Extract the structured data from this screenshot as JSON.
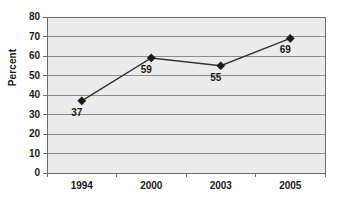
{
  "chart_data": {
    "type": "line",
    "title": "",
    "xlabel": "",
    "ylabel": "Percent",
    "categories": [
      "1994",
      "2000",
      "2003",
      "2005"
    ],
    "values": [
      37,
      59,
      55,
      69
    ],
    "point_labels": [
      "37",
      "59",
      "55",
      "69"
    ],
    "series": [
      {
        "name": "Percent",
        "values": [
          37,
          59,
          55,
          69
        ]
      }
    ],
    "ylim": [
      0,
      80
    ],
    "ytick_step": 10,
    "ytick_labels": [
      "0",
      "10",
      "20",
      "30",
      "40",
      "50",
      "60",
      "70",
      "80"
    ],
    "xtick_labels": [
      "1994",
      "2000",
      "2003",
      "2005"
    ],
    "grid": "horizontal",
    "legend": "none",
    "marker": "diamond",
    "colors": {
      "plot_background": "#ebebeb",
      "gridline": "#8c8c8c",
      "axis": "#6e6e6e",
      "series_line": "#333333",
      "marker": "#1a1a1a",
      "text": "#1a1a1a",
      "page_background": "#ffffff"
    }
  }
}
